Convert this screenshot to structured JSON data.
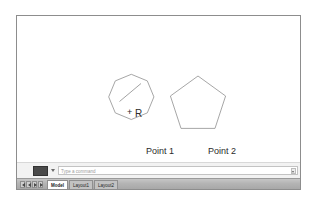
{
  "app": {
    "name": "cad-drawing-window"
  },
  "canvas": {
    "background_color": "#ffffff",
    "shapes": [
      {
        "id": "octagon",
        "type": "polygon",
        "sides": 8,
        "center": [
          118,
          101
        ],
        "radius": 28,
        "rotation_deg": 22.5,
        "stroke": "#9c9c9c",
        "fill": "none"
      },
      {
        "id": "pentagon",
        "type": "polygon",
        "sides": 5,
        "center": [
          197,
          104
        ],
        "radius": 29,
        "rotation_deg": -90,
        "stroke": "#9c9c9c",
        "fill": "none"
      }
    ],
    "radius_line": {
      "id": "radius-leader",
      "from": [
        118,
        101
      ],
      "to": [
        140,
        84
      ],
      "stroke": "#6f6f6f",
      "style": "solid"
    },
    "center_marker": {
      "id": "center-cross",
      "at": [
        112,
        101
      ],
      "glyph": "+",
      "color": "#2b2b2b"
    },
    "annotations": {
      "radius_label": "R",
      "point_1_label": "Point 1",
      "point_2_label": "Point 2"
    }
  },
  "command_bar": {
    "button_label": "",
    "dropdown_icon": "chevron-down-icon",
    "input_value": "",
    "input_placeholder": "Type a command",
    "scroll_icon": "scroll-down-arrow-icon"
  },
  "status_bar": {
    "nav_buttons": [
      {
        "name": "first-layout-button",
        "icon": "first-arrow-icon"
      },
      {
        "name": "previous-layout-button",
        "icon": "prev-arrow-icon"
      },
      {
        "name": "next-layout-button",
        "icon": "next-arrow-icon"
      },
      {
        "name": "last-layout-button",
        "icon": "last-arrow-icon"
      }
    ],
    "tabs": [
      {
        "label": "Model",
        "active": true
      },
      {
        "label": "Layout1",
        "active": false
      },
      {
        "label": "Layout2",
        "active": false
      }
    ]
  },
  "colors": {
    "shape_stroke": "#9c9c9c",
    "text": "#2b2b2b",
    "window_border": "#8d8d8d",
    "status_bar_bg": "#b4b4b4",
    "command_bar_bg": "#f2f2f2"
  }
}
